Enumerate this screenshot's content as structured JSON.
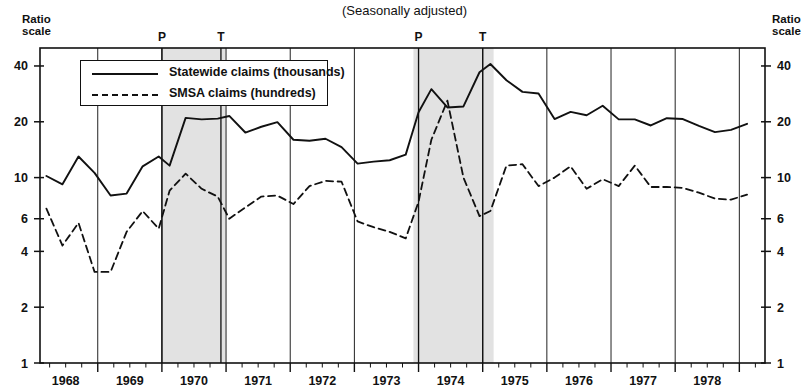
{
  "title": "(Seasonally adjusted)",
  "axis_note_left": "Ratio\nscale",
  "axis_note_right": "Ratio\nscale",
  "legend": {
    "items": [
      {
        "label": "Statewide claims (thousands)",
        "style": "solid",
        "color": "#111111"
      },
      {
        "label": "SMSA claims (hundreds)",
        "style": "dashed",
        "color": "#111111"
      }
    ]
  },
  "markers": [
    {
      "label": "P",
      "x_year": 1969.5
    },
    {
      "label": "T",
      "x_year": 1970.42
    },
    {
      "label": "P",
      "x_year": 1973.5
    },
    {
      "label": "T",
      "x_year": 1974.5
    }
  ],
  "recession_bands": [
    {
      "start": 1969.5,
      "end": 1970.5,
      "color": "#e2e2e2"
    },
    {
      "start": 1973.42,
      "end": 1974.67,
      "color": "#e2e2e2"
    }
  ],
  "chart_data": {
    "type": "line",
    "title": "(Seasonally adjusted)",
    "xlabel": "",
    "ylabel": "Ratio scale",
    "yscale": "log",
    "ylim": [
      1,
      50
    ],
    "xlim": [
      1967.6,
      1978.9
    ],
    "grid": false,
    "legend_position": "upper-left",
    "ytick_labels": [
      1,
      2,
      4,
      6,
      10,
      20,
      40
    ],
    "xtick_labels": [
      1968,
      1969,
      1970,
      1971,
      1972,
      1973,
      1974,
      1975,
      1976,
      1977,
      1978
    ],
    "series": [
      {
        "name": "Statewide claims (thousands)",
        "style": "solid",
        "x": [
          1967.7,
          1967.95,
          1968.2,
          1968.45,
          1968.7,
          1968.95,
          1969.2,
          1969.45,
          1969.62,
          1969.87,
          1970.12,
          1970.37,
          1970.55,
          1970.8,
          1971.05,
          1971.3,
          1971.55,
          1971.8,
          1972.05,
          1972.3,
          1972.55,
          1972.8,
          1973.05,
          1973.3,
          1973.5,
          1973.7,
          1973.95,
          1974.2,
          1974.45,
          1974.62,
          1974.87,
          1975.12,
          1975.37,
          1975.62,
          1975.87,
          1976.12,
          1976.37,
          1976.62,
          1976.87,
          1977.12,
          1977.37,
          1977.62,
          1977.87,
          1978.12,
          1978.37,
          1978.62
        ],
        "y": [
          10.2,
          9.2,
          13.0,
          10.6,
          8.0,
          8.2,
          11.5,
          13.0,
          11.6,
          21.0,
          20.6,
          20.8,
          21.5,
          17.5,
          18.8,
          19.9,
          16.0,
          15.8,
          16.2,
          14.6,
          11.9,
          12.2,
          12.4,
          13.3,
          22.5,
          30.0,
          23.9,
          24.2,
          37.0,
          41.0,
          33.5,
          29.0,
          28.4,
          20.7,
          22.6,
          21.7,
          24.4,
          20.6,
          20.6,
          19.1,
          20.9,
          20.7,
          19.0,
          17.6,
          18.1,
          19.5
        ]
      },
      {
        "name": "SMSA claims (hundreds)",
        "style": "dashed",
        "x": [
          1967.7,
          1967.95,
          1968.2,
          1968.45,
          1968.7,
          1968.95,
          1969.2,
          1969.45,
          1969.62,
          1969.87,
          1970.12,
          1970.37,
          1970.55,
          1970.8,
          1971.05,
          1971.3,
          1971.55,
          1971.8,
          1972.05,
          1972.3,
          1972.55,
          1972.8,
          1973.05,
          1973.3,
          1973.5,
          1973.7,
          1973.95,
          1974.2,
          1974.45,
          1974.62,
          1974.87,
          1975.12,
          1975.37,
          1975.62,
          1975.87,
          1976.12,
          1976.37,
          1976.62,
          1976.87,
          1977.12,
          1977.37,
          1977.62,
          1977.87,
          1978.12,
          1978.37,
          1978.62
        ],
        "y": [
          6.8,
          4.3,
          5.7,
          3.1,
          3.1,
          5.1,
          6.6,
          5.3,
          8.5,
          10.5,
          8.7,
          7.9,
          6.0,
          6.9,
          7.9,
          8.0,
          7.2,
          9.0,
          9.6,
          9.5,
          5.8,
          5.4,
          5.1,
          4.7,
          7.4,
          16.0,
          26.0,
          10.0,
          6.2,
          6.6,
          11.6,
          11.8,
          9.0,
          10.0,
          11.5,
          8.7,
          9.8,
          9.0,
          11.6,
          8.9,
          8.9,
          8.8,
          8.3,
          7.7,
          7.6,
          8.1
        ]
      }
    ]
  }
}
